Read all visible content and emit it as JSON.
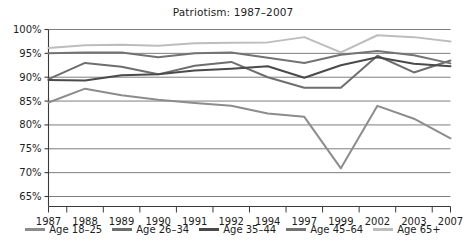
{
  "chart_data": {
    "type": "line",
    "title": "Patriotism: 1987–2007",
    "xlabel": "",
    "ylabel": "",
    "categories": [
      "1987",
      "1988",
      "1989",
      "1990",
      "1991",
      "1992",
      "1994",
      "1997",
      "1999",
      "2002",
      "2003",
      "2007"
    ],
    "ylim": [
      65,
      100
    ],
    "ytick_values": [
      65,
      70,
      75,
      80,
      85,
      90,
      95,
      100
    ],
    "ytick_labels": [
      "65%",
      "70%",
      "75%",
      "80%",
      "85%",
      "90%",
      "95%",
      "100%"
    ],
    "grid": true,
    "legend_position": "bottom",
    "series": [
      {
        "name": "Age 18–25",
        "color": "#8c8c8c",
        "values": [
          84.7,
          87.6,
          86.2,
          85.3,
          84.6,
          84.0,
          82.4,
          81.7,
          70.9,
          84.0,
          81.3,
          77.2
        ]
      },
      {
        "name": "Age 26–34",
        "color": "#6e6e6e",
        "values": [
          89.6,
          93.0,
          92.2,
          90.6,
          92.4,
          93.2,
          90.0,
          87.8,
          87.8,
          94.5,
          91.0,
          93.5
        ]
      },
      {
        "name": "Age 35–44",
        "color": "#4a4a4a",
        "values": [
          89.4,
          89.3,
          90.4,
          90.6,
          91.4,
          91.8,
          92.3,
          89.9,
          92.5,
          94.2,
          92.8,
          92.3
        ]
      },
      {
        "name": "Age 45–64",
        "color": "#737373",
        "values": [
          95.0,
          95.2,
          95.2,
          94.2,
          95.0,
          95.2,
          94.1,
          93.0,
          94.7,
          95.5,
          94.6,
          92.9
        ]
      },
      {
        "name": "Age 65+",
        "color": "#bdbdbd",
        "values": [
          96.1,
          96.7,
          96.8,
          96.6,
          97.1,
          97.2,
          97.3,
          98.4,
          95.2,
          98.8,
          98.4,
          97.5
        ]
      }
    ]
  },
  "legend": {
    "entries": [
      {
        "label": "Age 18–25"
      },
      {
        "label": "Age 26–34"
      },
      {
        "label": "Age 35–44"
      },
      {
        "label": "Age 45–64"
      },
      {
        "label": "Age 65+"
      }
    ]
  }
}
